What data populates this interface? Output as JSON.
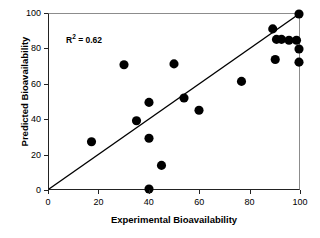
{
  "chart_data": {
    "type": "scatter",
    "title": "",
    "xlabel": "Experimental Bioavailability",
    "ylabel": "Predicted Bioavailability",
    "xlim": [
      0,
      100
    ],
    "ylim": [
      0,
      100
    ],
    "xticks": [
      0,
      20,
      40,
      60,
      80,
      100
    ],
    "yticks": [
      0,
      20,
      40,
      60,
      80,
      100
    ],
    "grid": false,
    "legend": null,
    "annotations": [
      {
        "name": "r-squared",
        "prefix": "R",
        "superscript": "2",
        "suffix": " = 0.62",
        "text": "R2 = 0.62",
        "value": 0.62,
        "x": 8,
        "y": 89
      }
    ],
    "reference_line": {
      "name": "identity-line",
      "label": "y = x",
      "slope": 1,
      "intercept": 0,
      "x0": 0,
      "y0": 0,
      "x1": 100,
      "y1": 100,
      "color": "#000000",
      "width": 1.4
    },
    "marker": {
      "shape": "circle",
      "color": "#000000",
      "size": 4.6
    },
    "series": [
      {
        "name": "Bioavailability predictions",
        "color": "#000000",
        "points": [
          {
            "x": 17,
            "y": 27
          },
          {
            "x": 30,
            "y": 71
          },
          {
            "x": 35,
            "y": 39
          },
          {
            "x": 40,
            "y": 49.5
          },
          {
            "x": 40,
            "y": 29
          },
          {
            "x": 40,
            "y": 0
          },
          {
            "x": 45,
            "y": 13.5
          },
          {
            "x": 50,
            "y": 71.5
          },
          {
            "x": 54,
            "y": 52
          },
          {
            "x": 60,
            "y": 45
          },
          {
            "x": 77,
            "y": 61.5
          },
          {
            "x": 89.5,
            "y": 91.5
          },
          {
            "x": 90.5,
            "y": 74
          },
          {
            "x": 91,
            "y": 85.5
          },
          {
            "x": 93,
            "y": 85.5
          },
          {
            "x": 96,
            "y": 85
          },
          {
            "x": 99,
            "y": 85
          },
          {
            "x": 100,
            "y": 80
          },
          {
            "x": 100,
            "y": 72.5
          },
          {
            "x": 100,
            "y": 100
          }
        ]
      }
    ]
  }
}
